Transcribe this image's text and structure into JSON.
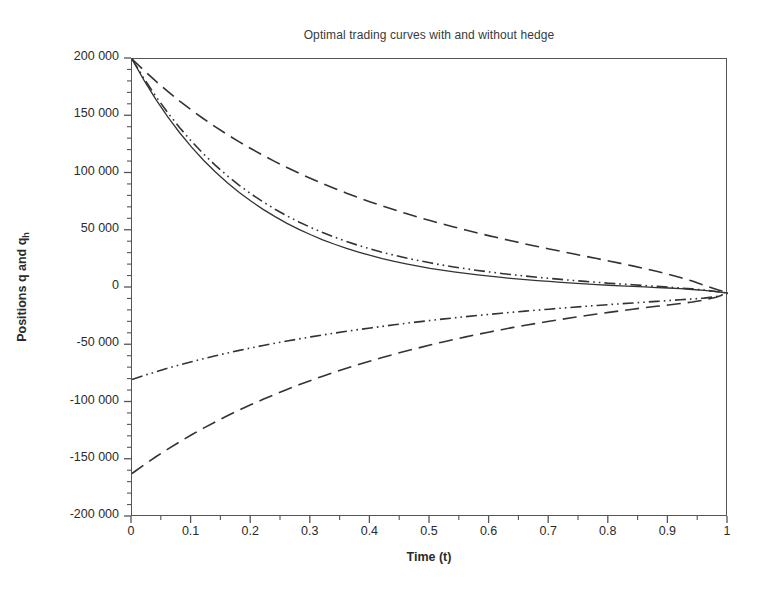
{
  "chart_data": {
    "type": "line",
    "title": "Optimal trading curves with and without hedge",
    "xlabel": "Time (t)",
    "ylabel": "Positions q and q_h",
    "ylabel_main": "Positions q and q",
    "ylabel_sub": "h",
    "xlim": [
      0,
      1
    ],
    "ylim": [
      -200000,
      200000
    ],
    "grid": false,
    "legend": "none",
    "x_ticks": [
      0,
      0.1,
      0.2,
      0.3,
      0.4,
      0.5,
      0.6,
      0.7,
      0.8,
      0.9,
      1
    ],
    "x_tick_labels": [
      "0",
      "0.1",
      "0.2",
      "0.3",
      "0.4",
      "0.5",
      "0.6",
      "0.7",
      "0.8",
      "0.9",
      "1"
    ],
    "x_minor_ticks": [
      0.05,
      0.15,
      0.25,
      0.35,
      0.45,
      0.55,
      0.65,
      0.75,
      0.85,
      0.95
    ],
    "y_ticks": [
      200000,
      150000,
      100000,
      50000,
      0,
      -50000,
      -100000,
      -150000,
      -200000
    ],
    "y_tick_labels": [
      "200 000",
      "150 000",
      "100 000",
      "50 000",
      "0",
      "-50 000",
      "-100 000",
      "-150 000",
      "-200 000"
    ],
    "y_minor_tick_step": 10000,
    "line_color": "#333333",
    "x": [
      0,
      0.02,
      0.04,
      0.06,
      0.08,
      0.1,
      0.12,
      0.14,
      0.16,
      0.18,
      0.2,
      0.22,
      0.24,
      0.26,
      0.28,
      0.3,
      0.32,
      0.34,
      0.36,
      0.38,
      0.4,
      0.42,
      0.44,
      0.46,
      0.48,
      0.5,
      0.52,
      0.54,
      0.56,
      0.58,
      0.6,
      0.62,
      0.64,
      0.66,
      0.68,
      0.7,
      0.72,
      0.74,
      0.76,
      0.78,
      0.8,
      0.82,
      0.84,
      0.86,
      0.88,
      0.9,
      0.92,
      0.94,
      0.96,
      0.98,
      1
    ],
    "series": [
      {
        "name": "q (no hedge, solid)",
        "style": "solid",
        "values": [
          200000,
          181500,
          164700,
          149400,
          135600,
          123000,
          111600,
          101300,
          91900,
          83400,
          75700,
          68700,
          62300,
          56500,
          51200,
          46500,
          42100,
          38200,
          34600,
          31400,
          28400,
          25700,
          23300,
          21100,
          19100,
          17200,
          15600,
          14100,
          12700,
          11400,
          10300,
          9200,
          8200,
          7300,
          6400,
          5700,
          4900,
          4300,
          3600,
          3000,
          2400,
          1900,
          1400,
          900,
          400,
          0,
          -600,
          -1300,
          -2100,
          -3100,
          -4500
        ]
      },
      {
        "name": "q_h (with hedge, dash-dot-dot upper)",
        "style": "dashdotdot",
        "values": [
          200000,
          183000,
          167400,
          153100,
          140000,
          128000,
          117100,
          107100,
          98000,
          89700,
          82100,
          75200,
          68800,
          63000,
          57700,
          52900,
          48400,
          44400,
          40600,
          37200,
          34100,
          31200,
          28600,
          26200,
          24000,
          22000,
          20100,
          18400,
          16800,
          15300,
          14000,
          12700,
          11500,
          10400,
          9400,
          8400,
          7500,
          6600,
          5800,
          5000,
          4200,
          3500,
          2800,
          2100,
          1400,
          700,
          0,
          -800,
          -1800,
          -3000,
          -4500
        ]
      },
      {
        "name": "q (no hedge, long dash upper)",
        "style": "dashed",
        "values": [
          200000,
          190000,
          180600,
          171700,
          163300,
          155300,
          147800,
          140700,
          134000,
          127600,
          121600,
          115800,
          110400,
          105200,
          100300,
          95600,
          91100,
          86900,
          82800,
          78900,
          75200,
          71700,
          68300,
          65000,
          61900,
          58900,
          56000,
          53300,
          50600,
          48000,
          45500,
          43100,
          40800,
          38500,
          36300,
          34100,
          32000,
          29900,
          27800,
          25700,
          23600,
          21500,
          19300,
          17000,
          14600,
          12000,
          9200,
          6100,
          2400,
          -1000,
          -4500
        ]
      },
      {
        "name": "q_h (with hedge, dash-dot-dot lower)",
        "style": "dashdotdot",
        "values": [
          -80000,
          -76500,
          -73200,
          -70100,
          -67200,
          -64400,
          -61700,
          -59200,
          -56800,
          -54500,
          -52300,
          -50200,
          -48200,
          -46300,
          -44500,
          -42700,
          -41000,
          -39400,
          -37800,
          -36300,
          -34900,
          -33500,
          -32100,
          -30800,
          -29600,
          -28400,
          -27200,
          -26100,
          -25000,
          -24000,
          -23000,
          -22000,
          -21100,
          -20200,
          -19300,
          -18500,
          -17600,
          -16800,
          -16000,
          -15300,
          -14500,
          -13800,
          -13100,
          -12400,
          -11700,
          -11000,
          -10300,
          -9600,
          -8800,
          -7500,
          -4500
        ]
      },
      {
        "name": "q (no hedge, long dash lower)",
        "style": "dashed",
        "values": [
          -162000,
          -154500,
          -147400,
          -140700,
          -134300,
          -128200,
          -122400,
          -116900,
          -111600,
          -106600,
          -101800,
          -97200,
          -92800,
          -88600,
          -84600,
          -80700,
          -77000,
          -73500,
          -70100,
          -66800,
          -63700,
          -60700,
          -57800,
          -55000,
          -52400,
          -49800,
          -47300,
          -45000,
          -42700,
          -40500,
          -38400,
          -36400,
          -34400,
          -32600,
          -30800,
          -29000,
          -27400,
          -25800,
          -24200,
          -22700,
          -21300,
          -19900,
          -18500,
          -17200,
          -16000,
          -14800,
          -13600,
          -12200,
          -10500,
          -8000,
          -4500
        ]
      }
    ]
  }
}
